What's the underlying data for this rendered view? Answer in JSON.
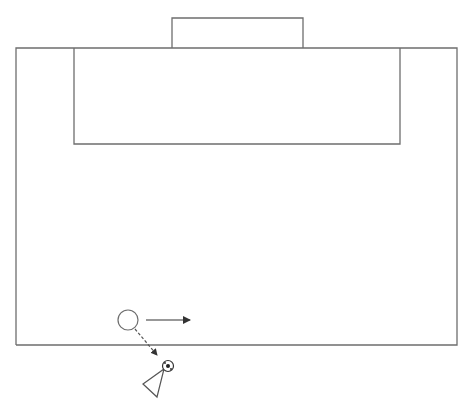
{
  "diagram": {
    "type": "soccer-drill",
    "colors": {
      "lines": "#6e6e6e",
      "arrows": "#333333",
      "background": "#ffffff"
    },
    "elements": [
      {
        "kind": "pitch-boundary",
        "label": "half-pitch outline"
      },
      {
        "kind": "goal",
        "label": "goal"
      },
      {
        "kind": "penalty-area",
        "label": "penalty box"
      },
      {
        "kind": "player",
        "label": "player (circle)"
      },
      {
        "kind": "run-arrow",
        "label": "player run",
        "style": "solid"
      },
      {
        "kind": "pass-arrow",
        "label": "ball path",
        "style": "dashed"
      },
      {
        "kind": "ball",
        "label": "soccer ball"
      },
      {
        "kind": "cone",
        "label": "cone / opponent (triangle)"
      }
    ]
  }
}
